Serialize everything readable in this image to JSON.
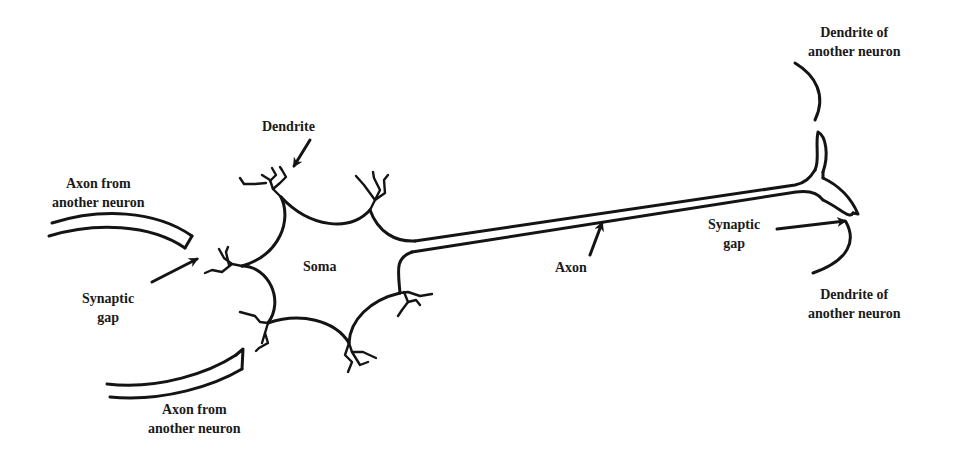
{
  "diagram": {
    "labels": {
      "dendrite": "Dendrite",
      "soma": "Soma",
      "axon": "Axon",
      "axon_from_top": [
        "Axon from",
        "another neuron"
      ],
      "axon_from_bottom": [
        "Axon from",
        "another neuron"
      ],
      "synaptic_gap_left": [
        "Synaptic",
        "gap"
      ],
      "synaptic_gap_right": [
        "Synaptic",
        "gap"
      ],
      "dendrite_other_top": [
        "Dendrite of",
        "another neuron"
      ],
      "dendrite_other_bottom": [
        "Dendrite of",
        "another neuron"
      ]
    },
    "colors": {
      "line": "#141414",
      "text": "#1a1a1a",
      "background": "#ffffff"
    }
  }
}
